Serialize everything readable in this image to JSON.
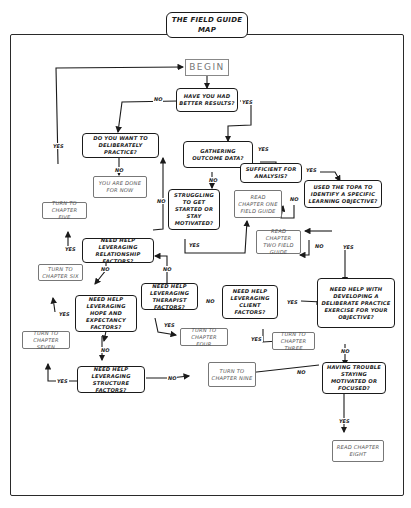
{
  "title": "THE FIELD GUIDE MAP",
  "nodes": {
    "begin": "BEGIN",
    "better_results": "HAVE YOU HAD BETTER RESULTS?",
    "deliberate": "DO YOU WANT TO DELIBERATELY PRACTICE?",
    "done": "YOU ARE DONE FOR NOW",
    "gathering": "GATHERING OUTCOME DATA?",
    "sufficient": "SUFFICIENT FOR ANALYSIS?",
    "struggling": "STRUGGLING TO GET STARTED OR STAY MOTIVATED?",
    "ch1": "READ CHAPTER ONE FIELD GUIDE",
    "topa": "USED THE TOPA TO IDENTIFY A SPECIFIC LEARNING OBJECTIVE?",
    "ch2": "READ CHAPTER TWO FIELD GUIDE",
    "ch5": "TURN TO CHAPTER FIVE",
    "relationship": "NEED HELP LEVERAGING RELATIONSHIP FACTORS?",
    "ch6": "TURN TO CHAPTER SIX",
    "hope": "NEED HELP LEVERAGING HOPE AND EXPECTANCY FACTORS?",
    "therapist": "NEED HELP LEVERAGING THERAPIST FACTORS?",
    "client": "NEED HELP LEVERAGING CLIENT FACTORS?",
    "develop": "NEED HELP WITH DEVELOPING A DELIBERATE PRACTICE EXERCISE FOR YOUR OBJECTIVE?",
    "ch4": "TURN TO CHAPTER FOUR",
    "ch3": "TURN TO CHAPTER THREE",
    "ch7": "TURN TO CHAPTER SEVEN",
    "structure": "NEED HELP LEVERAGING STRUCTURE FACTORS?",
    "ch9": "TURN TO CHAPTER NINE",
    "trouble": "HAVING TROUBLE STAYING MOTIVATED OR FOCUSED?",
    "ch8": "READ CHAPTER EIGHT"
  },
  "labels": {
    "yes": "YES",
    "no": "NO"
  }
}
